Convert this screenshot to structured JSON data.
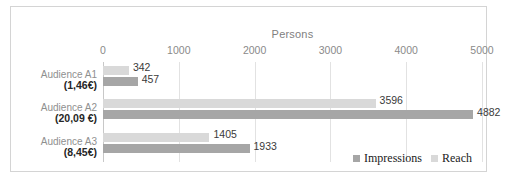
{
  "chart_data": {
    "type": "bar",
    "orientation": "horizontal",
    "title": "",
    "xlabel": "Persons",
    "ylabel": "",
    "xlim": [
      0,
      5000
    ],
    "xticks": [
      0,
      1000,
      2000,
      3000,
      4000,
      5000
    ],
    "xtick_labels": [
      "0",
      "1000",
      "2000",
      "3000",
      "4000",
      "5000"
    ],
    "grid": true,
    "legend_position": "bottom-right",
    "categories": [
      "Audience A1",
      "Audience A2",
      "Audience A3"
    ],
    "category_sublabels": [
      "(1,46€)",
      "(20,09 €)",
      "(8,45€)"
    ],
    "series": [
      {
        "name": "Impressions",
        "color": "#a6a6a6",
        "values": [
          457,
          4882,
          1933
        ]
      },
      {
        "name": "Reach",
        "color": "#d9d9d9",
        "values": [
          342,
          3596,
          1405
        ]
      }
    ],
    "bar_order_top_to_bottom": [
      "Reach",
      "Impressions"
    ],
    "data_labels": {
      "Audience A1": {
        "Reach": "342",
        "Impressions": "457"
      },
      "Audience A2": {
        "Reach": "3596",
        "Impressions": "4882"
      },
      "Audience A3": {
        "Reach": "1405",
        "Impressions": "1933"
      }
    }
  },
  "axis_title": "Persons",
  "legend": {
    "items": [
      {
        "label": "Impressions",
        "color": "#a6a6a6"
      },
      {
        "label": "Reach",
        "color": "#d9d9d9"
      }
    ]
  }
}
